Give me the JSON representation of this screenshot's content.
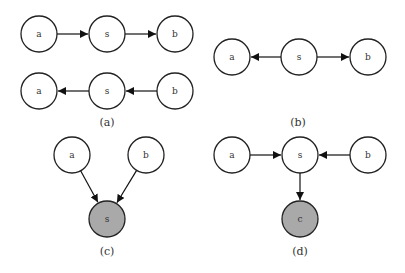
{
  "colors": {
    "observed_fill": "#a9a9a9",
    "latent_fill": "#ffffff",
    "stroke": "#222222"
  },
  "panels": [
    {
      "id": "a",
      "caption": "(a)",
      "caption_pos": [
        107,
        126
      ],
      "nodes": [
        {
          "id": "a1",
          "label": "a",
          "x": 39,
          "y": 34,
          "observed": false
        },
        {
          "id": "s1",
          "label": "s",
          "x": 107,
          "y": 34,
          "observed": false
        },
        {
          "id": "b1",
          "label": "b",
          "x": 175,
          "y": 34,
          "observed": false
        },
        {
          "id": "a2",
          "label": "a",
          "x": 39,
          "y": 91,
          "observed": false
        },
        {
          "id": "s2",
          "label": "s",
          "x": 107,
          "y": 91,
          "observed": false
        },
        {
          "id": "b2",
          "label": "b",
          "x": 175,
          "y": 91,
          "observed": false
        }
      ],
      "edges": [
        [
          "a1",
          "s1"
        ],
        [
          "s1",
          "b1"
        ],
        [
          "b2",
          "s2"
        ],
        [
          "s2",
          "a2"
        ]
      ]
    },
    {
      "id": "b",
      "caption": "(b)",
      "caption_pos": [
        298,
        126
      ],
      "nodes": [
        {
          "id": "a",
          "label": "a",
          "x": 232,
          "y": 57,
          "observed": false
        },
        {
          "id": "s",
          "label": "s",
          "x": 299,
          "y": 57,
          "observed": false
        },
        {
          "id": "b",
          "label": "b",
          "x": 368,
          "y": 57,
          "observed": false
        }
      ],
      "edges": [
        [
          "s",
          "a"
        ],
        [
          "s",
          "b"
        ]
      ]
    },
    {
      "id": "c",
      "caption": "(c)",
      "caption_pos": [
        107,
        255
      ],
      "nodes": [
        {
          "id": "a",
          "label": "a",
          "x": 72,
          "y": 155,
          "observed": false
        },
        {
          "id": "b",
          "label": "b",
          "x": 146,
          "y": 155,
          "observed": false
        },
        {
          "id": "s",
          "label": "s",
          "x": 107,
          "y": 219,
          "observed": true
        }
      ],
      "edges": [
        [
          "a",
          "s"
        ],
        [
          "b",
          "s"
        ]
      ]
    },
    {
      "id": "d",
      "caption": "(d)",
      "caption_pos": [
        300,
        255
      ],
      "nodes": [
        {
          "id": "a",
          "label": "a",
          "x": 232,
          "y": 155,
          "observed": false
        },
        {
          "id": "s",
          "label": "s",
          "x": 300,
          "y": 155,
          "observed": false
        },
        {
          "id": "b",
          "label": "b",
          "x": 368,
          "y": 155,
          "observed": false
        },
        {
          "id": "c",
          "label": "c",
          "x": 300,
          "y": 219,
          "observed": true
        }
      ],
      "edges": [
        [
          "a",
          "s"
        ],
        [
          "b",
          "s"
        ],
        [
          "s",
          "c"
        ]
      ]
    }
  ],
  "node_radius": 18
}
